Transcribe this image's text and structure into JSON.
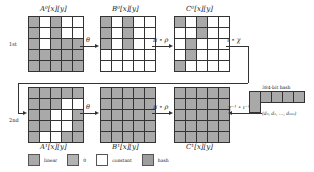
{
  "rounds": [
    {
      "label": "1st"
    },
    {
      "label": "2nd"
    }
  ],
  "states": {
    "A0": {
      "label": "A⁰[x][y]",
      "cells": [
        [
          "linear",
          "constant",
          "linear",
          "constant",
          "constant"
        ],
        [
          "linear",
          "constant",
          "linear",
          "constant",
          "constant"
        ],
        [
          "linear",
          "constant",
          "linear",
          "linear",
          "linear"
        ],
        [
          "linear",
          "linear",
          "linear",
          "linear",
          "linear"
        ],
        [
          "linear",
          "linear",
          "linear",
          "linear",
          "linear"
        ]
      ]
    },
    "B0": {
      "label": "B⁰[x][y]",
      "cells": [
        [
          "linear",
          "constant",
          "linear",
          "constant",
          "constant"
        ],
        [
          "linear",
          "constant",
          "linear",
          "constant",
          "constant"
        ],
        [
          "linear",
          "constant",
          "linear",
          "constant",
          "constant"
        ],
        [
          "constant",
          "constant",
          "constant",
          "constant",
          "constant"
        ],
        [
          "constant",
          "constant",
          "constant",
          "constant",
          "constant"
        ]
      ]
    },
    "C0": {
      "label": "C⁰[x][y]",
      "cells": [
        [
          "linear",
          "constant",
          "linear",
          "constant",
          "constant"
        ],
        [
          "constant",
          "constant",
          "linear",
          "constant",
          "constant"
        ],
        [
          "constant",
          "linear",
          "constant",
          "constant",
          "constant"
        ],
        [
          "constant",
          "linear",
          "constant",
          "constant",
          "constant"
        ],
        [
          "linear",
          "constant",
          "constant",
          "constant",
          "constant"
        ]
      ]
    },
    "A1": {
      "label": "A¹[x][y]",
      "cells": [
        [
          "linear",
          "linear",
          "linear",
          "linear",
          "linear"
        ],
        [
          "linear",
          "linear",
          "linear",
          "constant",
          "constant"
        ],
        [
          "linear",
          "linear",
          "constant",
          "constant",
          "linear"
        ],
        [
          "linear",
          "linear",
          "constant",
          "constant",
          "linear"
        ],
        [
          "linear",
          "constant",
          "constant",
          "linear",
          "linear"
        ]
      ]
    },
    "B1": {
      "label": "B¹[x][y]",
      "cells": [
        [
          "linear",
          "linear",
          "linear",
          "linear",
          "linear"
        ],
        [
          "linear",
          "linear",
          "linear",
          "linear",
          "linear"
        ],
        [
          "linear",
          "linear",
          "linear",
          "linear",
          "linear"
        ],
        [
          "linear",
          "linear",
          "linear",
          "linear",
          "linear"
        ],
        [
          "linear",
          "linear",
          "linear",
          "linear",
          "linear"
        ]
      ]
    },
    "C1": {
      "label": "C¹[x][y]",
      "cells": [
        [
          "linear",
          "linear",
          "linear",
          "linear",
          "linear"
        ],
        [
          "linear",
          "linear",
          "linear",
          "linear",
          "linear"
        ],
        [
          "linear",
          "linear",
          "linear",
          "linear",
          "linear"
        ],
        [
          "linear",
          "linear",
          "linear",
          "linear",
          "linear"
        ],
        [
          "linear",
          "linear",
          "linear",
          "linear",
          "linear"
        ]
      ]
    }
  },
  "operations": {
    "theta_1": "θ",
    "pi_rho_1": "π ∘ ρ",
    "iota_chi": "ι ∘ χ",
    "theta_2": "θ",
    "pi_rho_2": "π ∘ ρ",
    "chi_inv": "χ⁻¹ ∘ ι⁻¹"
  },
  "hash": {
    "title": "384-bit hash",
    "digest_label": "(d₀, d₁, …, d₃₈₃)",
    "cells_top": 5,
    "cells_bottom": 1
  },
  "legend": [
    {
      "key": "linear",
      "label": "linear",
      "color": "#a9a9a9"
    },
    {
      "key": "zero",
      "label": "0",
      "color": "#b3b3b3"
    },
    {
      "key": "constant",
      "label": "constant",
      "color": "#ffffff"
    },
    {
      "key": "hash",
      "label": "hash",
      "color": "#9e9e9e"
    }
  ]
}
